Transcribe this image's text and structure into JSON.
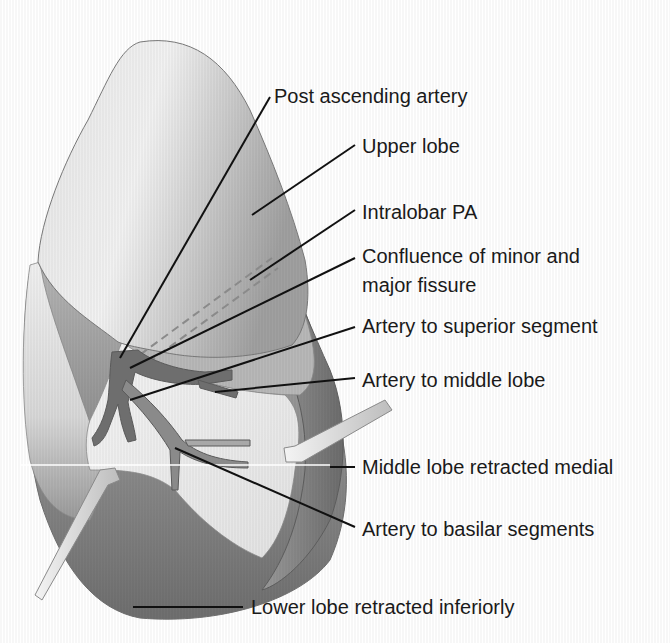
{
  "diagram": {
    "colors": {
      "upper_lobe_fill": "#c9c9c9",
      "lower_lobe_fill": "#7f7f7f",
      "middle_lobe_fill": "#e8e8e8",
      "artery_fill": "#6a6a6a",
      "retractor_fill": "#d6d6d6",
      "leader_line": "#111111",
      "text": "#1a1a1a",
      "background": "#ffffff"
    },
    "labels": [
      {
        "id": "post-ascending-artery",
        "text": "Post ascending artery"
      },
      {
        "id": "upper-lobe",
        "text": "Upper lobe"
      },
      {
        "id": "intralobar-pa",
        "text": "Intralobar PA"
      },
      {
        "id": "confluence-line1",
        "text": "Confluence of minor and"
      },
      {
        "id": "confluence-line2",
        "text": "major fissure"
      },
      {
        "id": "artery-superior-segment",
        "text": "Artery to superior segment"
      },
      {
        "id": "artery-middle-lobe",
        "text": "Artery to middle lobe"
      },
      {
        "id": "middle-lobe-retracted",
        "text": "Middle lobe retracted medial"
      },
      {
        "id": "artery-basilar-segments",
        "text": "Artery to basilar segments"
      },
      {
        "id": "lower-lobe-retracted",
        "text": "Lower lobe retracted inferiorly"
      }
    ]
  }
}
